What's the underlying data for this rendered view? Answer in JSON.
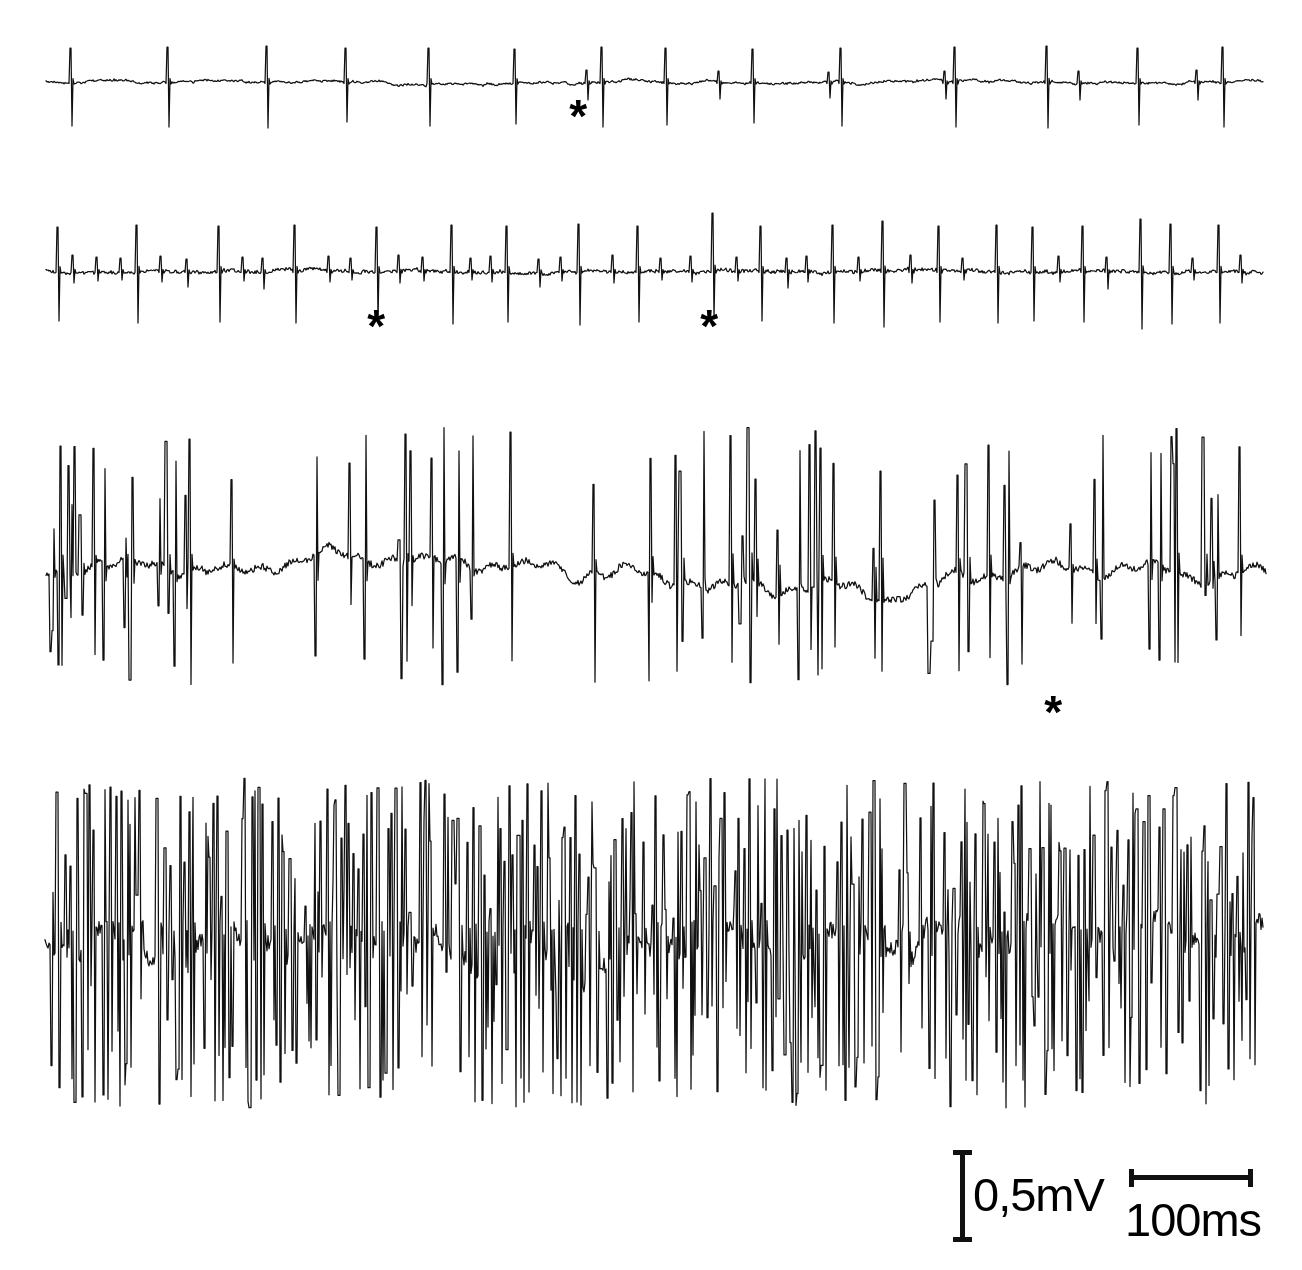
{
  "figure": {
    "background_color": "#ffffff",
    "trace_color": "#111111",
    "width": 1302,
    "height": 1270
  },
  "chart_data": {
    "type": "line",
    "xlabel": "",
    "ylabel": "",
    "grid": false,
    "legend": false,
    "x_scale": {
      "bar_label": "100ms",
      "bar_pixels": 122,
      "value": 100,
      "unit": "ms"
    },
    "y_scale": {
      "bar_label": "0,5mV",
      "bar_pixels": 88,
      "value": 0.5,
      "unit": "mV"
    },
    "series": [
      {
        "name": "trace-1",
        "description": "Minimal recruitment: single large motor unit firing regularly with flat baseline",
        "baseline_y": 82,
        "x_start": 46,
        "x_end": 1263,
        "spike_up": 36,
        "spike_down": 46,
        "noise_amplitude": 2.2,
        "seed": 1101,
        "large_spikes": [
          {
            "x": 70,
            "up": 34,
            "down": 44
          },
          {
            "x": 167,
            "up": 35,
            "down": 45
          },
          {
            "x": 266,
            "up": 36,
            "down": 46
          },
          {
            "x": 345,
            "up": 34,
            "down": 40
          },
          {
            "x": 428,
            "up": 34,
            "down": 44
          },
          {
            "x": 514,
            "up": 33,
            "down": 42
          },
          {
            "x": 601,
            "up": 35,
            "down": 45
          },
          {
            "x": 665,
            "up": 34,
            "down": 43
          },
          {
            "x": 752,
            "up": 33,
            "down": 41
          },
          {
            "x": 840,
            "up": 34,
            "down": 44
          },
          {
            "x": 954,
            "up": 35,
            "down": 45
          },
          {
            "x": 1046,
            "up": 36,
            "down": 46
          },
          {
            "x": 1137,
            "up": 34,
            "down": 43
          },
          {
            "x": 1222,
            "up": 35,
            "down": 45
          }
        ],
        "small_spikes": [
          {
            "x": 586,
            "up": 12,
            "down": 18
          },
          {
            "x": 718,
            "up": 11,
            "down": 17
          },
          {
            "x": 828,
            "up": 10,
            "down": 16
          },
          {
            "x": 944,
            "up": 11,
            "down": 17
          },
          {
            "x": 1078,
            "up": 11,
            "down": 18
          },
          {
            "x": 1196,
            "up": 12,
            "down": 18
          }
        ]
      },
      {
        "name": "trace-2",
        "description": "Mild recruitment: larger unit plus several smaller units, rate increased",
        "baseline_y": 271,
        "x_start": 46,
        "x_end": 1263,
        "spike_up": 48,
        "spike_down": 52,
        "noise_amplitude": 4.5,
        "seed": 2203,
        "large_spikes": [
          {
            "x": 57,
            "up": 44,
            "down": 50
          },
          {
            "x": 136,
            "up": 46,
            "down": 52
          },
          {
            "x": 218,
            "up": 45,
            "down": 51
          },
          {
            "x": 294,
            "up": 46,
            "down": 52
          },
          {
            "x": 376,
            "up": 44,
            "down": 50
          },
          {
            "x": 451,
            "up": 46,
            "down": 53
          },
          {
            "x": 506,
            "up": 45,
            "down": 51
          },
          {
            "x": 578,
            "up": 47,
            "down": 54
          },
          {
            "x": 637,
            "up": 45,
            "down": 51
          },
          {
            "x": 712,
            "up": 58,
            "down": 48
          },
          {
            "x": 760,
            "up": 45,
            "down": 50
          },
          {
            "x": 832,
            "up": 46,
            "down": 52
          },
          {
            "x": 882,
            "up": 50,
            "down": 56
          },
          {
            "x": 938,
            "up": 45,
            "down": 51
          },
          {
            "x": 996,
            "up": 46,
            "down": 52
          },
          {
            "x": 1032,
            "up": 44,
            "down": 50
          },
          {
            "x": 1082,
            "up": 45,
            "down": 51
          },
          {
            "x": 1140,
            "up": 52,
            "down": 58
          },
          {
            "x": 1170,
            "up": 47,
            "down": 53
          },
          {
            "x": 1218,
            "up": 46,
            "down": 52
          }
        ],
        "small_spikes": [
          {
            "x": 72,
            "up": 16,
            "down": 12
          },
          {
            "x": 96,
            "up": 14,
            "down": 10
          },
          {
            "x": 120,
            "up": 13,
            "down": 9
          },
          {
            "x": 160,
            "up": 15,
            "down": 11
          },
          {
            "x": 186,
            "up": 12,
            "down": 16
          },
          {
            "x": 242,
            "up": 14,
            "down": 10
          },
          {
            "x": 262,
            "up": 13,
            "down": 18
          },
          {
            "x": 328,
            "up": 15,
            "down": 11
          },
          {
            "x": 350,
            "up": 13,
            "down": 9
          },
          {
            "x": 398,
            "up": 16,
            "down": 12
          },
          {
            "x": 422,
            "up": 14,
            "down": 10
          },
          {
            "x": 470,
            "up": 13,
            "down": 9
          },
          {
            "x": 490,
            "up": 15,
            "down": 11
          },
          {
            "x": 538,
            "up": 12,
            "down": 16
          },
          {
            "x": 560,
            "up": 14,
            "down": 10
          },
          {
            "x": 612,
            "up": 16,
            "down": 12
          },
          {
            "x": 660,
            "up": 13,
            "down": 9
          },
          {
            "x": 690,
            "up": 15,
            "down": 11
          },
          {
            "x": 736,
            "up": 14,
            "down": 10
          },
          {
            "x": 786,
            "up": 13,
            "down": 17
          },
          {
            "x": 806,
            "up": 15,
            "down": 11
          },
          {
            "x": 858,
            "up": 14,
            "down": 10
          },
          {
            "x": 910,
            "up": 16,
            "down": 12
          },
          {
            "x": 962,
            "up": 13,
            "down": 9
          },
          {
            "x": 1058,
            "up": 15,
            "down": 11
          },
          {
            "x": 1106,
            "up": 14,
            "down": 18
          },
          {
            "x": 1192,
            "up": 13,
            "down": 9
          },
          {
            "x": 1240,
            "up": 16,
            "down": 12
          }
        ]
      },
      {
        "name": "trace-3",
        "description": "Moderate recruitment: dense multi-unit activity, many overlapping spikes",
        "baseline_y": 570,
        "x_start": 46,
        "x_end": 1266,
        "spike_up": 110,
        "spike_down": 95,
        "noise_amplitude": 12,
        "seed": 3307,
        "spike_density": 0.3,
        "large_spike_count": 72,
        "max_spike_up": 145,
        "max_spike_down": 115
      },
      {
        "name": "trace-4",
        "description": "Full recruitment: saturated interference pattern, individual units indistinguishable",
        "baseline_y": 940,
        "x_start": 45,
        "x_end": 1263,
        "spike_up": 160,
        "spike_down": 165,
        "noise_amplitude": 30,
        "seed": 4409,
        "spike_density": 0.95,
        "large_spike_count": 420,
        "max_spike_up": 162,
        "max_spike_down": 168
      }
    ],
    "annotations": [
      {
        "label": "*",
        "trace": "trace-1",
        "x": 583,
        "y": 122,
        "size": 46,
        "note": "small motor unit potential"
      },
      {
        "label": "*",
        "trace": "trace-2",
        "x": 381,
        "y": 332,
        "size": 46,
        "note": "small motor unit potential"
      },
      {
        "label": "*",
        "trace": "trace-2",
        "x": 714,
        "y": 332,
        "size": 46,
        "note": "small motor unit potential"
      },
      {
        "label": "*",
        "trace": "trace-3",
        "x": 1058,
        "y": 718,
        "size": 46,
        "note": "small motor unit potential"
      }
    ]
  },
  "scalebars": {
    "vertical": {
      "label": "0,5mV",
      "icon": "vertical-scale-bar-icon"
    },
    "horizontal": {
      "label": "100ms",
      "icon": "horizontal-scale-bar-icon"
    }
  }
}
